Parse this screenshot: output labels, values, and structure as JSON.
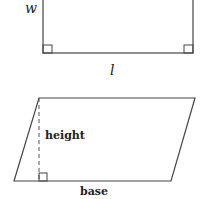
{
  "rectangle": {
    "width_label": "w",
    "length_label": "l",
    "geometry": {
      "left": 43,
      "right": 193,
      "top": -10,
      "bottom": 53
    },
    "right_angle_markers": 2
  },
  "parallelogram": {
    "height_label": "height",
    "base_label": "base",
    "vertices": {
      "top_left": [
        39,
        98
      ],
      "top_right": [
        195,
        98
      ],
      "bottom_right": [
        171,
        181
      ],
      "bottom_left": [
        14,
        181
      ]
    },
    "height_line": {
      "x": 39,
      "y1": 98,
      "y2": 181,
      "style": "dashed"
    },
    "right_angle_markers": 1
  },
  "colors": {
    "stroke": "#444444",
    "text": "#222222",
    "background": "#ffffff"
  }
}
